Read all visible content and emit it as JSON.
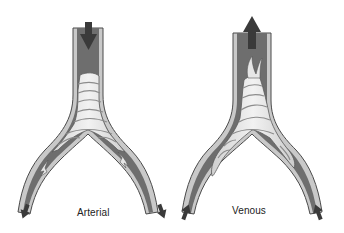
{
  "diagram": {
    "type": "vessel-bifurcation-thrombus-comparison",
    "panels": [
      {
        "id": "arterial",
        "label": "Arterial",
        "flow_direction": "downward (inflow at trunk top, outflow at both branch ends)",
        "arrows": [
          {
            "position": "trunk-top",
            "direction": "down"
          },
          {
            "position": "left-branch-end",
            "direction": "down-left"
          },
          {
            "position": "right-branch-end",
            "direction": "down-right"
          }
        ],
        "thrombus": "layered white thrombus at bifurcation with fragments extending into both branches"
      },
      {
        "id": "venous",
        "label": "Venous",
        "flow_direction": "upward (inflow at both branch ends, outflow at trunk top)",
        "arrows": [
          {
            "position": "trunk-top",
            "direction": "up"
          },
          {
            "position": "left-branch-end",
            "direction": "up-right"
          },
          {
            "position": "right-branch-end",
            "direction": "up-left"
          }
        ],
        "thrombus": "layered thrombus filling bifurcation, extending upward into trunk with tail"
      }
    ],
    "colors": {
      "vessel_lumen": "#6e6e6e",
      "vessel_wall": "#c9c9c9",
      "vessel_outline": "#4a4a4a",
      "thrombus_fill": "#e6e6e6",
      "thrombus_lines": "#8c8c8c",
      "arrow": "#3a3a3a"
    }
  }
}
